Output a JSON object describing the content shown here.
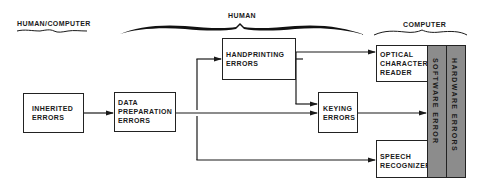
{
  "groups": {
    "human_computer": "HUMAN/COMPUTER",
    "human": "HUMAN",
    "computer": "COMPUTER"
  },
  "boxes": {
    "inherited": [
      "INHERITED",
      "ERRORS"
    ],
    "data_prep": [
      "DATA",
      "PREPARATION",
      "ERRORS"
    ],
    "handprinting": [
      "HANDPRINTING",
      "ERRORS"
    ],
    "keying": [
      "KEYING",
      "ERRORS"
    ],
    "ocr": [
      "OPTICAL",
      "CHARACTER",
      "READER"
    ],
    "speech": [
      "SPEECH",
      "RECOGNIZER"
    ]
  },
  "columns": {
    "software": "SOFTWARE ERROR",
    "hardware": "HARDWARE ERRORS"
  },
  "colors": {
    "line": "#1a1a1a",
    "column_fill": "#8c8c8c",
    "background": "#ffffff"
  }
}
